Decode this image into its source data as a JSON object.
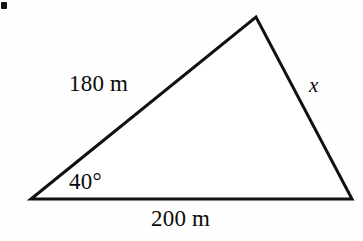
{
  "figure": {
    "background_color": "#fefefe",
    "stroke_color": "#111111",
    "text_color": "#0b0b0b",
    "stroke_width": 3,
    "corner_mark": {
      "name": "list-bullet-fragment",
      "color": "#111111"
    },
    "vertices": {
      "left": {
        "x": 31,
        "y": 199
      },
      "apex": {
        "x": 256,
        "y": 17
      },
      "right": {
        "x": 352,
        "y": 199
      }
    },
    "labels": {
      "side_left": "180 m",
      "side_base": "200 m",
      "side_right": "x",
      "angle_left": "40°"
    }
  },
  "chart_data": {
    "type": "diagram",
    "shape": "triangle",
    "vertices": [
      {
        "name": "A",
        "x": 31,
        "y": 199,
        "role": "left-vertex"
      },
      {
        "name": "B",
        "x": 256,
        "y": 17,
        "role": "apex-vertex"
      },
      {
        "name": "C",
        "x": 352,
        "y": 199,
        "role": "right-vertex"
      }
    ],
    "edges": [
      {
        "from": "A",
        "to": "B",
        "label": "180 m",
        "value": 180,
        "unit": "m"
      },
      {
        "from": "A",
        "to": "C",
        "label": "200 m",
        "value": 200,
        "unit": "m"
      },
      {
        "from": "B",
        "to": "C",
        "label": "x",
        "value": null,
        "unit": "m"
      }
    ],
    "angles": [
      {
        "at": "A",
        "label": "40°",
        "value": 40,
        "unit": "degrees"
      }
    ],
    "unknowns": [
      "x"
    ],
    "grid": false,
    "legend": null
  }
}
